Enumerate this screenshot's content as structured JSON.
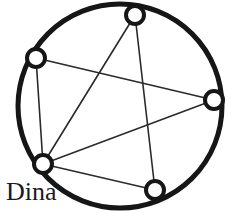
{
  "diagram": {
    "title": "Dina",
    "type": "circle-graph",
    "colors": {
      "background": "#ffffff",
      "circle_stroke": "#161616",
      "chord_stroke": "#2a2a2a",
      "node_stroke": "#161616",
      "node_fill": "#ffffff",
      "label_text": "#1a1a1a"
    },
    "circle": {
      "cx": 120,
      "cy": 106,
      "r": 102,
      "stroke_width": 5
    },
    "node_style": {
      "radius": 9,
      "stroke_width": 4
    },
    "chord_style": {
      "stroke_width": 1.6
    },
    "nodes": [
      {
        "id": "top",
        "name": "node-top",
        "cx": 135,
        "cy": 15
      },
      {
        "id": "upper-left",
        "name": "node-upper-left",
        "cx": 36,
        "cy": 58
      },
      {
        "id": "right",
        "name": "node-right",
        "cx": 214,
        "cy": 100
      },
      {
        "id": "dina",
        "name": "node-dina",
        "cx": 43,
        "cy": 164
      },
      {
        "id": "bottom",
        "name": "node-bottom",
        "cx": 155,
        "cy": 190
      }
    ],
    "edges": [
      {
        "id": "e1",
        "from": "upper-left",
        "to": "dina",
        "x1": 36,
        "y1": 58,
        "x2": 43,
        "y2": 164
      },
      {
        "id": "e2",
        "from": "upper-left",
        "to": "right",
        "x1": 36,
        "y1": 58,
        "x2": 214,
        "y2": 100
      },
      {
        "id": "e3",
        "from": "top",
        "to": "dina",
        "x1": 135,
        "y1": 15,
        "x2": 43,
        "y2": 164
      },
      {
        "id": "e4",
        "from": "top",
        "to": "bottom",
        "x1": 135,
        "y1": 15,
        "x2": 155,
        "y2": 190
      },
      {
        "id": "e5",
        "from": "right",
        "to": "dina",
        "x1": 214,
        "y1": 100,
        "x2": 43,
        "y2": 164
      },
      {
        "id": "e6",
        "from": "dina",
        "to": "bottom",
        "x1": 43,
        "y1": 164,
        "x2": 155,
        "y2": 190
      }
    ],
    "labels": [
      {
        "id": "dina-label",
        "text": "Dina",
        "x": 6,
        "y": 200,
        "font_size": 26
      }
    ]
  }
}
